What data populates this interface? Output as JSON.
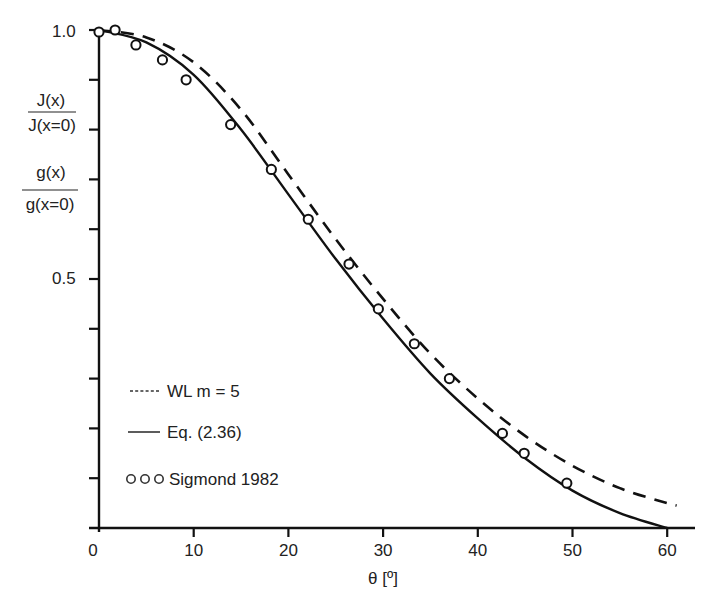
{
  "chart_data": {
    "type": "line",
    "title": "",
    "xlabel": "θ [º]",
    "ylabel_lines": [
      {
        "numerator": "J(x)",
        "denominator": "J(x=0)"
      },
      {
        "numerator": "g(x)",
        "denominator": "g(x=0)"
      }
    ],
    "xlim": [
      0,
      63
    ],
    "ylim": [
      0,
      1.0
    ],
    "x_ticks": [
      0,
      10,
      20,
      30,
      40,
      50,
      60
    ],
    "x_tick_labels": [
      "0",
      "10",
      "20",
      "30",
      "40",
      "50",
      "60"
    ],
    "y_ticks": [
      0,
      0.1,
      0.2,
      0.3,
      0.4,
      0.5,
      0.6,
      0.7,
      0.8,
      0.9,
      1.0
    ],
    "y_tick_labels": {
      "0.5": "0.5",
      "1.0": "1.0"
    },
    "grid": false,
    "legend_position": "lower-left",
    "series": [
      {
        "name": "WL m = 5",
        "legend_marker": "-----",
        "style": "dashed",
        "x": [
          0,
          5,
          10,
          15,
          20,
          25,
          30,
          35,
          40,
          45,
          50,
          55,
          60,
          61
        ],
        "values": [
          1.0,
          0.985,
          0.935,
          0.84,
          0.71,
          0.58,
          0.46,
          0.35,
          0.26,
          0.185,
          0.125,
          0.08,
          0.05,
          0.045
        ]
      },
      {
        "name": "Eq. (2.36)",
        "legend_marker": "——",
        "style": "solid",
        "x": [
          0,
          5,
          10,
          15,
          20,
          25,
          30,
          35,
          40,
          45,
          50,
          55,
          60
        ],
        "values": [
          1.0,
          0.975,
          0.91,
          0.8,
          0.67,
          0.54,
          0.42,
          0.31,
          0.22,
          0.14,
          0.075,
          0.03,
          0.0
        ]
      },
      {
        "name": "Sigmond 1982",
        "legend_marker": "o o o",
        "style": "markers",
        "x": [
          0,
          1.7,
          3.9,
          6.7,
          9.2,
          13.9,
          18.2,
          22.1,
          26.4,
          29.5,
          33.3,
          37.0,
          42.6,
          44.9,
          49.4
        ],
        "values": [
          0.996,
          1.0,
          0.97,
          0.94,
          0.9,
          0.81,
          0.72,
          0.62,
          0.53,
          0.44,
          0.37,
          0.3,
          0.19,
          0.15,
          0.09
        ]
      }
    ]
  }
}
